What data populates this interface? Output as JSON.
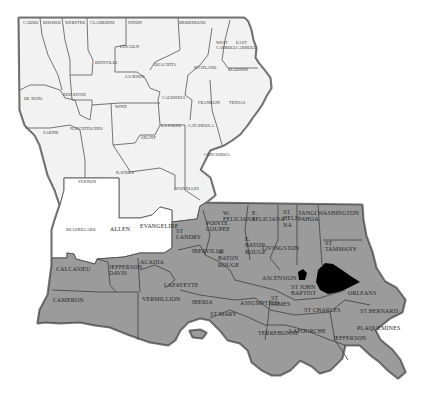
{
  "map": {
    "title": "Louisiana Parishes",
    "colors": {
      "north_fill": "#f2f2f2",
      "west_white_fill": "#ffffff",
      "south_fill": "#9b9b9b",
      "lake_fill": "#000000",
      "border": "#6a6a6a",
      "background": "#ffffff"
    },
    "north_parishes": [
      {
        "label": "CADDO",
        "x": 23,
        "y": 21
      },
      {
        "label": "BOSSIER",
        "x": 43,
        "y": 21
      },
      {
        "label": "WEBSTER",
        "x": 65,
        "y": 21
      },
      {
        "label": "CLAIBORNE",
        "x": 90,
        "y": 21
      },
      {
        "label": "UNION",
        "x": 128,
        "y": 21
      },
      {
        "label": "MOREHOUSE",
        "x": 179,
        "y": 21
      },
      {
        "label": "WEST\nCARROLL",
        "x": 216,
        "y": 41
      },
      {
        "label": "EAST\nCARROLL",
        "x": 236,
        "y": 41
      },
      {
        "label": "LINCOLN",
        "x": 120,
        "y": 45
      },
      {
        "label": "BIENVILLE",
        "x": 95,
        "y": 61
      },
      {
        "label": "OUACHITA",
        "x": 154,
        "y": 63
      },
      {
        "label": "RICHLAND",
        "x": 194,
        "y": 66
      },
      {
        "label": "MADISON",
        "x": 228,
        "y": 68
      },
      {
        "label": "JACKSON",
        "x": 125,
        "y": 75
      },
      {
        "label": "DE SOTO",
        "x": 24,
        "y": 97
      },
      {
        "label": "RED RIVER",
        "x": 63,
        "y": 93
      },
      {
        "label": "CALDWELL",
        "x": 162,
        "y": 96
      },
      {
        "label": "FRANKLIN",
        "x": 198,
        "y": 101
      },
      {
        "label": "TENSAS",
        "x": 229,
        "y": 101
      },
      {
        "label": "WINN",
        "x": 115,
        "y": 105
      },
      {
        "label": "NATCHITOCHES",
        "x": 70,
        "y": 127
      },
      {
        "label": "LA SALLE",
        "x": 161,
        "y": 124
      },
      {
        "label": "CATAHOULA",
        "x": 188,
        "y": 124
      },
      {
        "label": "SABINE",
        "x": 43,
        "y": 131
      },
      {
        "label": "GRANT",
        "x": 141,
        "y": 136
      },
      {
        "label": "CONCORDIA",
        "x": 204,
        "y": 153
      },
      {
        "label": "RAPIDES",
        "x": 116,
        "y": 171
      },
      {
        "label": "VERNON",
        "x": 78,
        "y": 180
      },
      {
        "label": "AVOYELLES",
        "x": 174,
        "y": 187
      }
    ],
    "west_white_parishes": [
      {
        "label": "BEAUREGARD",
        "x": 66,
        "y": 228
      },
      {
        "label": "ALLEN",
        "x": 110,
        "y": 226
      },
      {
        "label": "EVANGELINE",
        "x": 140,
        "y": 223
      }
    ],
    "south_parishes": [
      {
        "label": "ST\nLANDRY",
        "x": 176,
        "y": 228
      },
      {
        "label": "POINTE\nCOUPEE",
        "x": 206,
        "y": 220
      },
      {
        "label": "W.\nFELICIANA",
        "x": 223,
        "y": 210
      },
      {
        "label": "E.\nFELICIANA",
        "x": 252,
        "y": 210
      },
      {
        "label": "ST\nHELE\nNA",
        "x": 283,
        "y": 209
      },
      {
        "label": "TANGI\nPAHOA",
        "x": 298,
        "y": 210
      },
      {
        "label": "WASHINGTON",
        "x": 318,
        "y": 210
      },
      {
        "label": "IBERVILLE",
        "x": 192,
        "y": 248
      },
      {
        "label": "W.\nBATON\nROUGE",
        "x": 218,
        "y": 249
      },
      {
        "label": "E.\nBATON\nROUGE",
        "x": 245,
        "y": 236
      },
      {
        "label": "LIVINGSTON",
        "x": 262,
        "y": 245
      },
      {
        "label": "ST\nTAMMANY",
        "x": 325,
        "y": 240
      },
      {
        "label": "CALCASIEU",
        "x": 56,
        "y": 266
      },
      {
        "label": "JEFFERSON\nDAVIS",
        "x": 109,
        "y": 264
      },
      {
        "label": "ACADIA",
        "x": 140,
        "y": 259
      },
      {
        "label": "LAFAYETTE",
        "x": 164,
        "y": 282
      },
      {
        "label": "ASCENSION",
        "x": 262,
        "y": 275
      },
      {
        "label": "ST JOHN\nBAPTIST",
        "x": 291,
        "y": 284
      },
      {
        "label": "ORLEANS",
        "x": 348,
        "y": 290
      },
      {
        "label": "CAMERON",
        "x": 53,
        "y": 297
      },
      {
        "label": "VERMILLION",
        "x": 142,
        "y": 296
      },
      {
        "label": "IBERIA",
        "x": 192,
        "y": 299
      },
      {
        "label": "ASSUMPTION",
        "x": 240,
        "y": 300
      },
      {
        "label": "ST\nJAMES",
        "x": 271,
        "y": 295
      },
      {
        "label": "ST CHARLES",
        "x": 304,
        "y": 307
      },
      {
        "label": "ST BERNARD",
        "x": 360,
        "y": 308
      },
      {
        "label": "ST MARY",
        "x": 210,
        "y": 311
      },
      {
        "label": "TERREBONNE",
        "x": 258,
        "y": 330
      },
      {
        "label": "LAFOURCHE",
        "x": 289,
        "y": 328
      },
      {
        "label": "PLAQUEMINES",
        "x": 357,
        "y": 325
      },
      {
        "label": "JEFFERSON",
        "x": 333,
        "y": 335
      }
    ]
  }
}
